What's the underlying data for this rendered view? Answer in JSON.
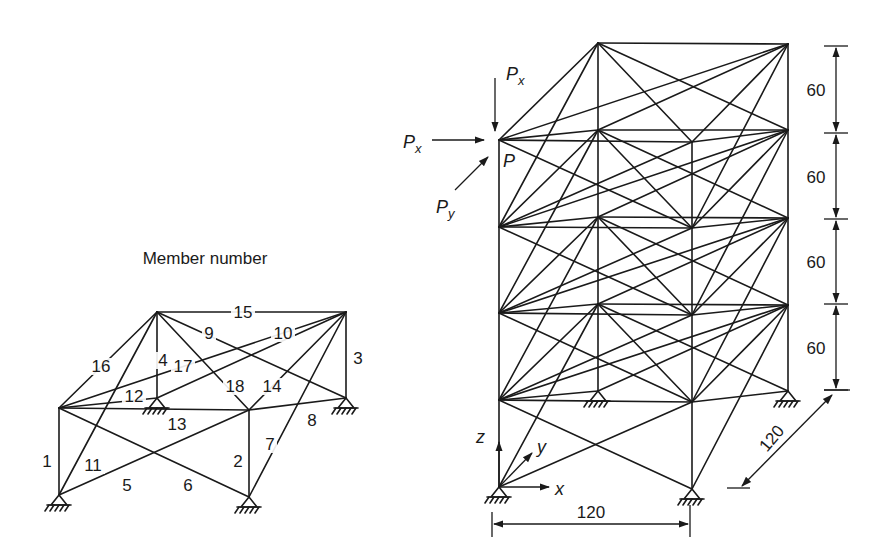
{
  "member_diagram": {
    "title": "Member number",
    "nodes": {
      "A": [
        59,
        495
      ],
      "B": [
        249,
        497
      ],
      "C": [
        157,
        398
      ],
      "D": [
        346,
        398
      ],
      "A2": [
        59,
        408
      ],
      "B2": [
        249,
        410
      ],
      "C2": [
        157,
        312
      ],
      "D2": [
        346,
        312
      ]
    },
    "supports": [
      "A",
      "B",
      "C",
      "D"
    ],
    "members": [
      {
        "id": "1",
        "from": "A",
        "to": "A2",
        "label_pos": [
          47,
          467
        ]
      },
      {
        "id": "2",
        "from": "B",
        "to": "B2",
        "label_pos": [
          238,
          467
        ]
      },
      {
        "id": "3",
        "from": "D",
        "to": "D2",
        "label_pos": [
          358,
          364
        ]
      },
      {
        "id": "4",
        "from": "C",
        "to": "C2",
        "label_pos": [
          163,
          366
        ]
      },
      {
        "id": "5",
        "from": "A",
        "to": "B2",
        "label_pos": [
          127,
          491
        ]
      },
      {
        "id": "6",
        "from": "A2",
        "to": "B",
        "label_pos": [
          188,
          491
        ]
      },
      {
        "id": "7",
        "from": "B",
        "to": "D2",
        "label_pos": [
          270,
          450
        ]
      },
      {
        "id": "8",
        "from": "B2",
        "to": "D",
        "label_pos": [
          312,
          426
        ]
      },
      {
        "id": "9",
        "from": "C2",
        "to": "D",
        "label_pos": [
          209,
          339
        ]
      },
      {
        "id": "10",
        "from": "C",
        "to": "D2",
        "label_pos": [
          283,
          339
        ]
      },
      {
        "id": "11",
        "from": "A",
        "to": "C2",
        "label_pos": [
          93,
          471
        ]
      },
      {
        "id": "12",
        "from": "A2",
        "to": "C",
        "label_pos": [
          134,
          402
        ]
      },
      {
        "id": "13",
        "from": "A2",
        "to": "B2",
        "label_pos": [
          177,
          430
        ]
      },
      {
        "id": "14",
        "from": "B2",
        "to": "D2",
        "label_pos": [
          272,
          392
        ]
      },
      {
        "id": "15",
        "from": "C2",
        "to": "D2",
        "label_pos": [
          243,
          318
        ]
      },
      {
        "id": "16",
        "from": "A2",
        "to": "C2",
        "label_pos": [
          101,
          372
        ]
      },
      {
        "id": "17",
        "from": "A2",
        "to": "D2",
        "label_pos": [
          183,
          372
        ]
      },
      {
        "id": "18",
        "from": "B2",
        "to": "C2",
        "label_pos": [
          235,
          392
        ]
      }
    ]
  },
  "tower": {
    "levels": 5,
    "front_left": {
      "x": 499,
      "y": [
        487,
        400,
        313,
        227,
        140
      ]
    },
    "front_right": {
      "x": 692,
      "y": [
        489,
        402,
        315,
        228,
        142
      ]
    },
    "back_left": {
      "x": 598,
      "y": [
        391,
        304,
        217,
        130,
        43
      ]
    },
    "back_right": {
      "x": 788,
      "y": [
        391,
        305,
        218,
        130,
        44
      ]
    },
    "bay_pattern": [
      [
        "A",
        "A2"
      ],
      [
        "B",
        "B2"
      ],
      [
        "D",
        "D2"
      ],
      [
        "C",
        "C2"
      ],
      [
        "A",
        "B2"
      ],
      [
        "A2",
        "B"
      ],
      [
        "B",
        "D2"
      ],
      [
        "B2",
        "D"
      ],
      [
        "C2",
        "D"
      ],
      [
        "C",
        "D2"
      ],
      [
        "A",
        "C2"
      ],
      [
        "A2",
        "C"
      ],
      [
        "A2",
        "B2"
      ],
      [
        "B2",
        "D2"
      ],
      [
        "C2",
        "D2"
      ],
      [
        "A2",
        "C2"
      ],
      [
        "A2",
        "D2"
      ],
      [
        "B2",
        "C2"
      ]
    ],
    "loads": {
      "px_horizontal": {
        "label": "P",
        "sub": "x"
      },
      "px_vertical": {
        "label": "P",
        "sub": "x"
      },
      "py": {
        "label": "P",
        "sub": "y"
      },
      "node_label": "P"
    },
    "axes": {
      "x": "x",
      "y": "y",
      "z": "z"
    },
    "dimensions": {
      "width": "120",
      "depth": "120",
      "heights": [
        "60",
        "60",
        "60",
        "60"
      ]
    }
  }
}
